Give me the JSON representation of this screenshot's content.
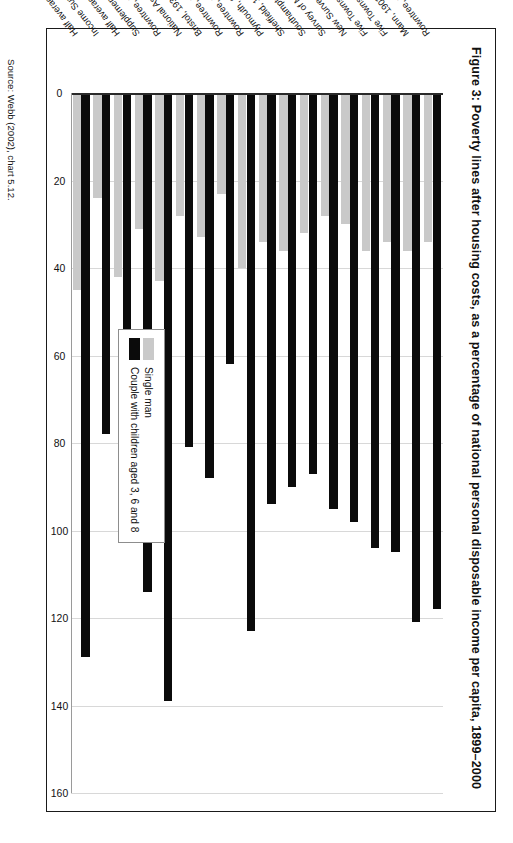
{
  "figure": {
    "title": "Figure 3: Poverty lines after housing costs, as a percentage of national personal disposable income per capita, 1899–2000",
    "source": "Source: Webb (2002), chart 5.12."
  },
  "legend": {
    "position": "inside-left",
    "items": [
      {
        "label": "Single man",
        "color": "#c9c9c9",
        "swatch": "legend-swatch-single-man"
      },
      {
        "label": "Couple with children aged 3, 6 and 8",
        "color": "#0b0b0b",
        "swatch": "legend-swatch-couple"
      }
    ]
  },
  "axis": {
    "tick_labels": [
      "0",
      "20",
      "40",
      "60",
      "80",
      "100",
      "120",
      "140",
      "160"
    ],
    "min": 0,
    "max": 160,
    "step": 20
  },
  "chart_data": {
    "type": "bar",
    "orientation": "horizontal",
    "title": "Figure 3: Poverty lines after housing costs, as a percentage of national personal disposable income per capita, 1899–2000",
    "xlabel": "",
    "ylabel": "",
    "xlim": [
      0,
      160
    ],
    "grid": true,
    "legend_position": "inside-left",
    "categories": [
      "Rowntree, 1899",
      "Mann, 1903",
      "Five Towns, 1913",
      "Five Towns, 1924",
      "New Survey of London, 1930",
      "Survey of Merseyside, 1930",
      "Southampton, 1931",
      "Sheffield, 1932",
      "Plymouth, 1933",
      "Rowntree, 1936 human needs",
      "Rowntree, 1936 primary",
      "Bristol, 1937",
      "National Assistance, 1948",
      "Rowntree, 1950",
      "Supplementary Benefit, 1979",
      "Half average income, 1979",
      "Income Support, 2000",
      "Half average income, 1999/00"
    ],
    "series": [
      {
        "name": "Single man",
        "color": "#c9c9c9",
        "values": [
          34,
          36,
          34,
          36,
          30,
          28,
          32,
          36,
          34,
          40,
          23,
          33,
          28,
          43,
          31,
          42,
          24,
          45
        ]
      },
      {
        "name": "Couple with children aged 3, 6 and 8",
        "color": "#0b0b0b",
        "values": [
          118,
          121,
          105,
          104,
          98,
          95,
          87,
          90,
          94,
          123,
          62,
          88,
          81,
          139,
          114,
          101,
          78,
          129
        ]
      }
    ]
  }
}
